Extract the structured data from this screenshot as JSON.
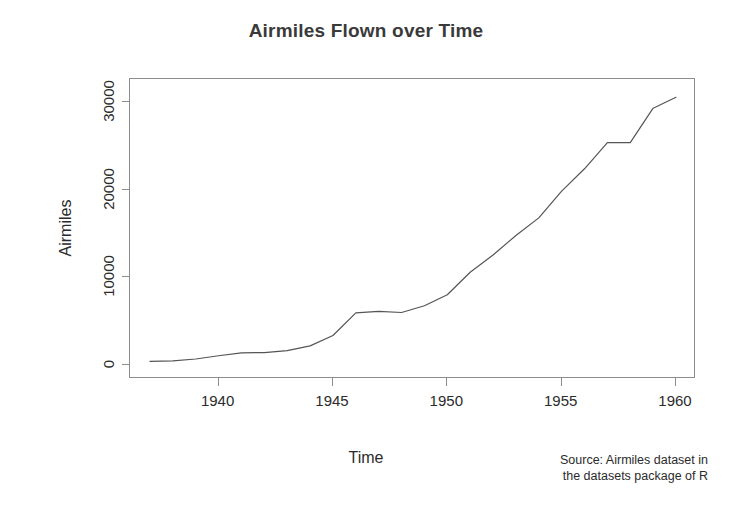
{
  "chart_data": {
    "type": "line",
    "title": "Airmiles Flown over Time",
    "xlabel": "Time",
    "ylabel": "Airmiles",
    "xlim": [
      1937,
      1960
    ],
    "ylim": [
      0,
      31000
    ],
    "grid": false,
    "legend": null,
    "line_color": "#555555",
    "x": [
      1937,
      1938,
      1939,
      1940,
      1941,
      1942,
      1943,
      1944,
      1945,
      1946,
      1947,
      1948,
      1949,
      1950,
      1951,
      1952,
      1953,
      1954,
      1955,
      1956,
      1957,
      1958,
      1959,
      1960
    ],
    "values": [
      412,
      480,
      683,
      1052,
      1385,
      1418,
      1634,
      2178,
      3362,
      5948,
      6109,
      5981,
      6753,
      8003,
      10566,
      12528,
      14760,
      16769,
      19819,
      22362,
      25340,
      25343,
      29269,
      30514
    ],
    "xticks": [
      1940,
      1945,
      1950,
      1955,
      1960
    ],
    "xtick_labels": [
      "1940",
      "1945",
      "1950",
      "1955",
      "1960"
    ],
    "yticks": [
      0,
      10000,
      20000,
      30000
    ],
    "ytick_labels": [
      "0",
      "10000",
      "20000",
      "30000"
    ],
    "annotations": [
      "Source: Airmiles dataset in",
      "the datasets package of R"
    ]
  },
  "source_note": {
    "line1": "Source: Airmiles dataset in",
    "line2": "the datasets package of R"
  },
  "axis": {
    "x_title": "Time",
    "y_title": "Airmiles"
  },
  "title": "Airmiles Flown over Time"
}
